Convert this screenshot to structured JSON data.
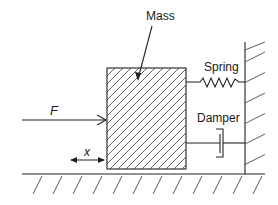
{
  "diagram": {
    "labels": {
      "mass": "Mass",
      "spring": "Spring",
      "damper": "Damper",
      "force": "F",
      "displacement": "x"
    },
    "components": [
      "mass",
      "spring",
      "damper",
      "wall",
      "ground",
      "force-arrow",
      "displacement-arrow"
    ],
    "colors": {
      "stroke": "#222222",
      "background": "#ffffff"
    }
  }
}
